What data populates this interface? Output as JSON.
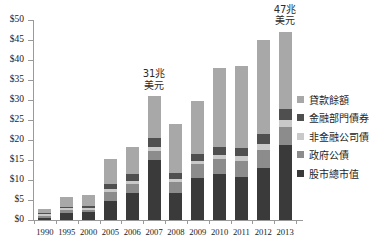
{
  "chart_data": {
    "type": "bar",
    "stacked": true,
    "title": "",
    "subtitle": "",
    "xlabel": "",
    "ylabel": "",
    "ylim": [
      0,
      50
    ],
    "ytick_step": 5,
    "grid": false,
    "legend_position": "right",
    "currency_prefix": "$",
    "categories": [
      "1990",
      "1995",
      "2000",
      "2005",
      "2006",
      "2007",
      "2008",
      "2009",
      "2010",
      "2011",
      "2012",
      "2013"
    ],
    "ytick_labels": [
      "$0",
      "$5",
      "$10",
      "$15",
      "$20",
      "$25",
      "$30",
      "$35",
      "$40",
      "$45",
      "$50"
    ],
    "ytick_values": [
      0,
      5,
      10,
      15,
      20,
      25,
      30,
      35,
      40,
      45,
      50
    ],
    "series": [
      {
        "name": "股市總市值",
        "color": "#3a3a3a",
        "values": [
          0.6,
          1.8,
          1.9,
          4.8,
          6.7,
          14.9,
          6.7,
          10.5,
          11.6,
          10.8,
          13.1,
          18.7
        ]
      },
      {
        "name": "政府公債",
        "color": "#8c8c8c",
        "values": [
          0.5,
          0.7,
          0.6,
          2.3,
          2.2,
          2.3,
          2.7,
          3.4,
          3.6,
          3.9,
          4.3,
          4.5
        ]
      },
      {
        "name": "非金融公司債",
        "color": "#c9c9c9",
        "values": [
          0.3,
          0.4,
          0.5,
          0.7,
          0.9,
          1.0,
          0.8,
          0.9,
          1.0,
          1.2,
          1.6,
          1.8
        ]
      },
      {
        "name": "金融部門債券",
        "color": "#4f4f4f",
        "values": [
          0.3,
          0.4,
          0.6,
          1.1,
          1.7,
          2.2,
          1.6,
          1.7,
          2.0,
          2.1,
          2.4,
          2.8
        ]
      },
      {
        "name": "貸款餘額",
        "color": "#a8a8a8",
        "values": [
          1.0,
          2.4,
          2.7,
          6.4,
          6.8,
          10.5,
          12.1,
          13.2,
          19.8,
          20.4,
          23.6,
          19.2
        ]
      }
    ],
    "totals": [
      2.7,
      5.7,
      6.3,
      15.3,
      18.3,
      30.9,
      23.9,
      29.7,
      38.0,
      38.4,
      45.0,
      47.0
    ],
    "annotations": [
      {
        "category": "2007",
        "line1": "31兆",
        "line2": "美元",
        "value": 31
      },
      {
        "category": "2013",
        "line1": "47兆",
        "line2": "美元",
        "value": 47
      }
    ]
  },
  "legend": {
    "items": [
      {
        "label": "貸款餘額",
        "color": "#a8a8a8"
      },
      {
        "label": "金融部門債券",
        "color": "#4f4f4f"
      },
      {
        "label": "非金融公司債",
        "color": "#c9c9c9"
      },
      {
        "label": "政府公債",
        "color": "#8c8c8c"
      },
      {
        "label": "股市總市值",
        "color": "#3a3a3a"
      }
    ]
  },
  "colors": {
    "axis": "#9a9a9a",
    "text": "#1a1a1a",
    "background": "#ffffff"
  }
}
